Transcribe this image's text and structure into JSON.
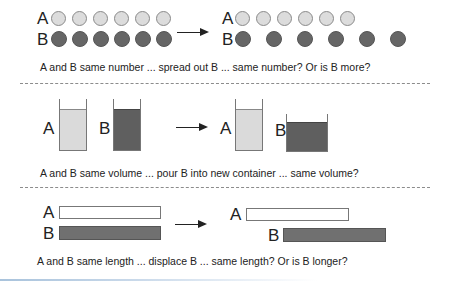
{
  "labels": {
    "a": "A",
    "b": "B"
  },
  "rows": [
    {
      "id": "number",
      "caption": "A and B same number ... spread out B ... same number? Or is B more?",
      "before": {
        "a_count": 6,
        "b_count": 6
      },
      "after": {
        "a_count": 6,
        "b_count": 6,
        "b_spread": true
      }
    },
    {
      "id": "volume",
      "caption": "A and B same volume ... pour B into new container ... same volume?",
      "before": {
        "a_container": "tall",
        "b_container": "tall"
      },
      "after": {
        "a_container": "tall",
        "b_container": "wide"
      }
    },
    {
      "id": "length",
      "caption": "A and B same length ... displace B ... same length? Or is B longer?",
      "before": {
        "b_offset": 0
      },
      "after": {
        "b_offset": 37
      }
    }
  ],
  "colors": {
    "light_fill": "#dcdcdc",
    "dark_fill": "#666666",
    "outline": "#777777",
    "divider": "#8c8c8c"
  },
  "icons": {
    "arrow": "right-arrow-icon"
  }
}
